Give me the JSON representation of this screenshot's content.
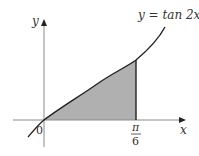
{
  "diagram": {
    "curve_label": "y = tan 2x",
    "x_axis_label": "x",
    "y_axis_label": "y",
    "origin_label": "0",
    "bound_label_numerator": "π",
    "bound_label_denominator": "6",
    "colors": {
      "axis": "#8a8a8a",
      "curve": "#222222",
      "shade": "#b0b0b0",
      "text": "#333333"
    }
  }
}
